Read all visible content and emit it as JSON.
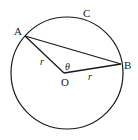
{
  "diagram": {
    "type": "circle-geometry",
    "colors": {
      "stroke": "#1a1a1a",
      "background": "#ffffff"
    },
    "circle": {
      "cx": 67,
      "cy": 73,
      "r": 56
    },
    "points": {
      "A": {
        "x": 25,
        "y": 36,
        "label": "A"
      },
      "B": {
        "x": 121,
        "y": 64,
        "label": "B"
      },
      "O": {
        "x": 64,
        "y": 73,
        "label": "O"
      }
    },
    "labels": {
      "circle_name": "C",
      "radius_left": "r",
      "radius_right": "r",
      "angle": "θ"
    },
    "segments": [
      {
        "from": "A",
        "to": "O",
        "label": "r"
      },
      {
        "from": "O",
        "to": "B",
        "label": "r"
      },
      {
        "from": "A",
        "to": "B",
        "label": ""
      }
    ]
  }
}
